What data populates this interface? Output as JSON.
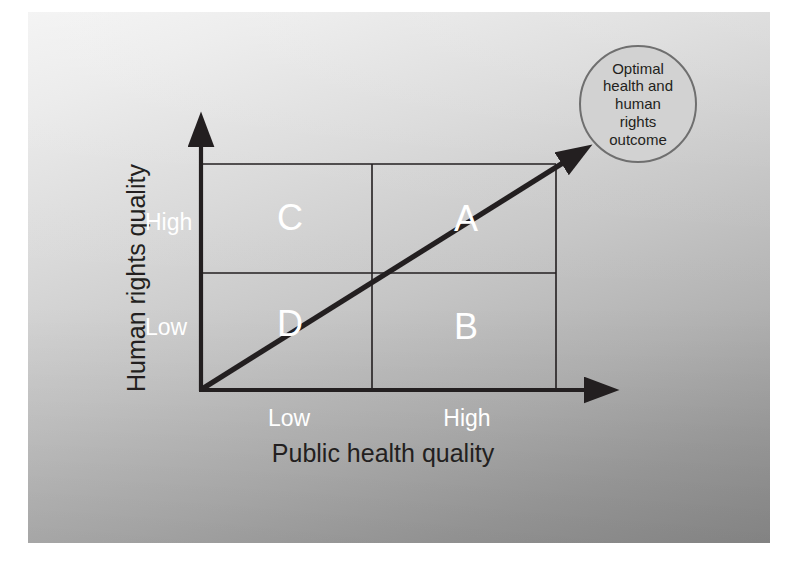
{
  "figure": {
    "type": "2x2-quadrant-diagram",
    "background_color": "#c6c6c6",
    "line_color": "#231f20",
    "label_color_axis_titles": "#231f20",
    "label_color_ticks": "#ffffff",
    "label_color_quadrants": "#ffffff"
  },
  "axes": {
    "x": {
      "title": "Public health quality",
      "ticks": [
        "Low",
        "High"
      ]
    },
    "y": {
      "title": "Human rights quality",
      "ticks": [
        "Low",
        "High"
      ]
    }
  },
  "quadrants": [
    {
      "letter": "C",
      "x": "Low",
      "y": "High"
    },
    {
      "letter": "A",
      "x": "High",
      "y": "High"
    },
    {
      "letter": "D",
      "x": "Low",
      "y": "Low"
    },
    {
      "letter": "B",
      "x": "High",
      "y": "Low"
    }
  ],
  "callout": {
    "text": "Optimal health and human rights outcome",
    "lines": [
      "Optimal",
      "health and",
      "human",
      "rights",
      "outcome"
    ],
    "fill_color": "#d2d2d2",
    "border_color": "#6f6f6f"
  },
  "diagonal_arrow": {
    "description": "arrow from origin through quadrants D and A to the optimal outcome",
    "from": "origin",
    "to": "callout"
  },
  "chart_data": {
    "type": "scatter",
    "title": "",
    "xlabel": "Public health quality",
    "ylabel": "Human rights quality",
    "xticklabels": [
      "Low",
      "High"
    ],
    "yticklabels": [
      "Low",
      "High"
    ],
    "xlim": [
      0,
      2
    ],
    "ylim": [
      0,
      2
    ],
    "grid": true,
    "legend": "none",
    "annotations": [
      {
        "label": "C",
        "x": 0.5,
        "y": 1.5
      },
      {
        "label": "A",
        "x": 1.5,
        "y": 1.5
      },
      {
        "label": "D",
        "x": 0.5,
        "y": 0.5
      },
      {
        "label": "B",
        "x": 1.5,
        "y": 0.5
      },
      {
        "label": "Optimal health and human rights outcome",
        "x": 2.3,
        "y": 2.4
      }
    ],
    "series": [
      {
        "name": "Optimal trajectory",
        "type": "line",
        "x": [
          0,
          2
        ],
        "y": [
          0,
          2
        ]
      }
    ]
  }
}
